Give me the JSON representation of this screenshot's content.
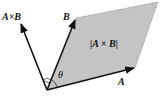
{
  "diagram": {
    "labels": {
      "cross": "A×B",
      "b": "B",
      "a": "A",
      "area": "|A × B|",
      "theta": "θ"
    },
    "colors": {
      "parallelogram_fill": "#c4c4c4",
      "stroke": "#111111",
      "background": "#ffffff"
    },
    "geometry": {
      "origin": [
        47,
        90
      ],
      "vector_a_tip": [
        134,
        68
      ],
      "vector_b_tip": [
        76,
        18
      ],
      "vector_cross_tip": [
        20,
        22
      ],
      "far_corner": [
        158,
        2
      ]
    }
  }
}
